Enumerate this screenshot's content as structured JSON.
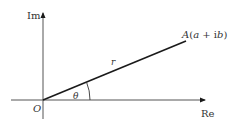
{
  "diagram": {
    "axes": {
      "imaginary_label": "Im",
      "real_label": "Re",
      "origin_label": "O"
    },
    "vector": {
      "length_label": "r",
      "angle_label": "θ",
      "point_label_prefix": "A",
      "point_label": "A(a + ib)"
    },
    "colors": {
      "stroke": "#1a1a1a",
      "text": "#333333"
    }
  }
}
